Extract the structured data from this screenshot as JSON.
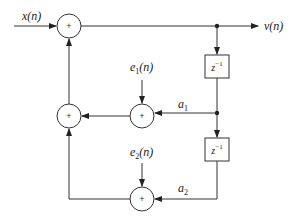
{
  "diagram": {
    "type": "block-diagram",
    "nodes": {
      "input": {
        "label": "x(n)"
      },
      "output": {
        "label": "v(n)"
      },
      "adder_top": {
        "symbol": "+"
      },
      "adder_left_mid": {
        "symbol": "+"
      },
      "adder_mid": {
        "symbol": "+"
      },
      "adder_bottom": {
        "symbol": "+"
      },
      "delay1": {
        "label_base": "z",
        "label_exp": "−1"
      },
      "delay2": {
        "label_base": "z",
        "label_exp": "−1"
      },
      "noise1": {
        "base": "e",
        "sub": "1",
        "arg": "(n)"
      },
      "noise2": {
        "base": "e",
        "sub": "2",
        "arg": "(n)"
      },
      "coef1": {
        "base": "a",
        "sub": "1"
      },
      "coef2": {
        "base": "a",
        "sub": "2"
      }
    },
    "edges": [
      {
        "from": "input",
        "to": "adder_top"
      },
      {
        "from": "adder_top",
        "to": "output"
      },
      {
        "from": "adder_top",
        "to": "delay1"
      },
      {
        "from": "delay1",
        "to": "delay2"
      },
      {
        "from": "delay1",
        "to": "adder_mid",
        "gain": "a1"
      },
      {
        "from": "noise1",
        "to": "adder_mid"
      },
      {
        "from": "adder_mid",
        "to": "adder_left_mid"
      },
      {
        "from": "delay2",
        "to": "adder_bottom",
        "gain": "a2"
      },
      {
        "from": "noise2",
        "to": "adder_bottom"
      },
      {
        "from": "adder_bottom",
        "to": "adder_left_mid"
      },
      {
        "from": "adder_left_mid",
        "to": "adder_top"
      }
    ]
  }
}
